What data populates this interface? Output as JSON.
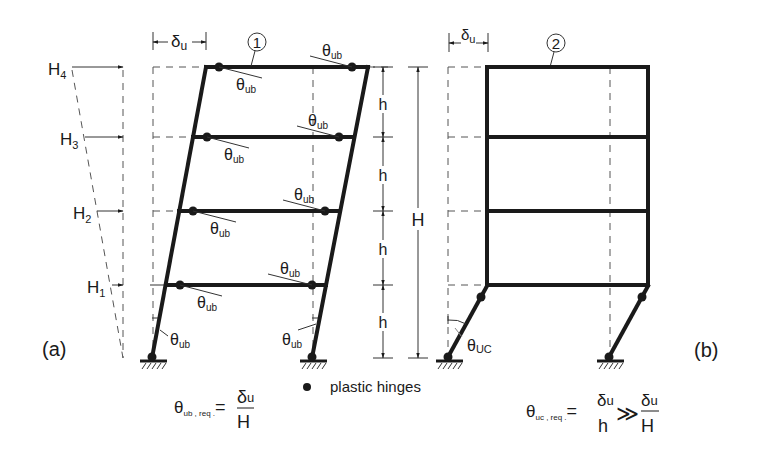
{
  "figure": {
    "panel_a": {
      "label": "(a)",
      "frame_marker": "1",
      "drift_label": "δ",
      "drift_sub": "u",
      "loads": [
        {
          "name": "H",
          "sub": "4"
        },
        {
          "name": "H",
          "sub": "3"
        },
        {
          "name": "H",
          "sub": "2"
        },
        {
          "name": "H",
          "sub": "1"
        }
      ],
      "rotation_label": "θ",
      "rotation_sub": "ub",
      "formula": {
        "lhs": "θ",
        "lhs_sub": "ub , req .",
        "eq": "=",
        "num": "δ",
        "num_sub": "u",
        "den": "H"
      }
    },
    "panel_b": {
      "label": "(b)",
      "frame_marker": "2",
      "drift_label": "δ",
      "drift_sub": "u",
      "rotation_label": "θ",
      "rotation_sub": "UC",
      "formula": {
        "lhs": "θ",
        "lhs_sub": "uc , req .",
        "eq": "=",
        "num1": "δ",
        "num1_sub": "u",
        "den1": "h",
        "gg": "≫",
        "num2": "δ",
        "num2_sub": "u",
        "den2": "H"
      }
    },
    "dimensions": {
      "storey": [
        "h",
        "h",
        "h",
        "h"
      ],
      "total": "H"
    },
    "legend": {
      "symbol": "●",
      "text": "plastic hinges"
    }
  }
}
